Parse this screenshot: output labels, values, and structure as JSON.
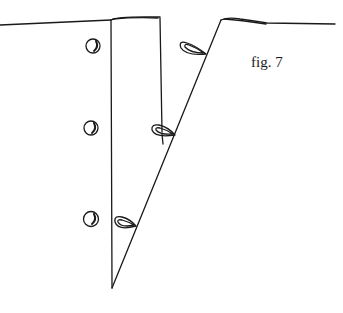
{
  "figure": {
    "caption": "fig. 7",
    "line_color": "#1a1a1a",
    "background": "#ffffff",
    "left_panel_buttons": 3,
    "button_loops": 3
  }
}
